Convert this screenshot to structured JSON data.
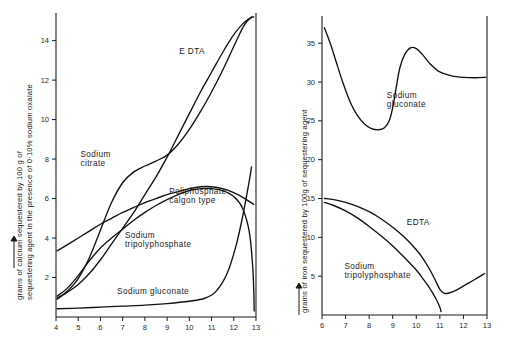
{
  "figure": {
    "background": "#ffffff",
    "ink_color": "#111111"
  },
  "chart_data": [
    {
      "id": "left-panel",
      "type": "line",
      "title": "",
      "xlabel": "",
      "ylabel": "grams of calcium sequestered by 100 g of sequestering agent in the presence of 0·10% sodium oxalate",
      "ylabel_line1": "grams of calcium sequestered by 100 g of",
      "ylabel_line2": "sequestering agent in the presence of 0·10% sodium oxalate",
      "xlim": [
        4,
        13
      ],
      "ylim": [
        0,
        15.4
      ],
      "xticks": [
        4,
        5,
        6,
        7,
        8,
        9,
        10,
        11,
        12,
        13
      ],
      "xticklabels": [
        "4",
        "5",
        "6",
        "7",
        "8",
        "9",
        "10",
        "11",
        "12",
        "13"
      ],
      "yticks": [
        2,
        4,
        6,
        8,
        10,
        12,
        14
      ],
      "yticklabels": [
        "2",
        "4",
        "6",
        "8",
        "10",
        "12",
        "14"
      ],
      "grid": false,
      "legend_position": "inline-labels",
      "series": [
        {
          "name": "EDTA",
          "label": "E DTA",
          "label_x": 9.55,
          "label_y": 13.3,
          "points": [
            [
              4.05,
              0.95
            ],
            [
              4.5,
              1.25
            ],
            [
              5.0,
              1.65
            ],
            [
              5.5,
              2.2
            ],
            [
              6.0,
              2.9
            ],
            [
              6.5,
              3.7
            ],
            [
              7.0,
              4.5
            ],
            [
              7.5,
              5.3
            ],
            [
              8.0,
              6.2
            ],
            [
              8.5,
              7.1
            ],
            [
              9.0,
              8.1
            ],
            [
              9.5,
              9.2
            ],
            [
              10.0,
              10.3
            ],
            [
              10.5,
              11.4
            ],
            [
              11.0,
              12.4
            ],
            [
              11.5,
              13.4
            ],
            [
              12.0,
              14.3
            ],
            [
              12.4,
              14.85
            ],
            [
              12.75,
              15.15
            ],
            [
              12.9,
              15.2
            ]
          ]
        },
        {
          "name": "Sodium citrate",
          "label_line1": "Sodium",
          "label_line2": "citrate",
          "label_x": 5.1,
          "label_y": 8.1,
          "points": [
            [
              4.05,
              0.9
            ],
            [
              4.5,
              1.3
            ],
            [
              5.0,
              1.95
            ],
            [
              5.5,
              3.0
            ],
            [
              6.0,
              4.4
            ],
            [
              6.5,
              5.8
            ],
            [
              7.0,
              6.8
            ],
            [
              7.5,
              7.35
            ],
            [
              8.0,
              7.65
            ],
            [
              8.5,
              7.9
            ],
            [
              9.0,
              8.2
            ],
            [
              9.5,
              8.75
            ],
            [
              10.0,
              9.5
            ],
            [
              10.5,
              10.4
            ],
            [
              11.0,
              11.4
            ],
            [
              11.5,
              12.5
            ],
            [
              12.0,
              13.7
            ],
            [
              12.45,
              14.75
            ],
            [
              12.8,
              15.2
            ]
          ]
        },
        {
          "name": "Poliphosphate calgon type",
          "label_line1": "Poliphosphate",
          "label_line2": "calgon type",
          "label_x": 9.1,
          "label_y": 6.25,
          "points": [
            [
              4.05,
              3.35
            ],
            [
              4.5,
              3.65
            ],
            [
              5.0,
              4.0
            ],
            [
              5.5,
              4.35
            ],
            [
              6.0,
              4.7
            ],
            [
              6.5,
              5.0
            ],
            [
              7.0,
              5.3
            ],
            [
              7.5,
              5.55
            ],
            [
              8.0,
              5.8
            ],
            [
              8.5,
              6.0
            ],
            [
              9.0,
              6.2
            ],
            [
              9.5,
              6.35
            ],
            [
              10.0,
              6.5
            ],
            [
              10.5,
              6.6
            ],
            [
              11.0,
              6.6
            ],
            [
              11.5,
              6.5
            ],
            [
              12.0,
              6.3
            ],
            [
              12.5,
              6.0
            ],
            [
              12.9,
              5.7
            ]
          ]
        },
        {
          "name": "Sodium tripolyphosphate",
          "label_line1": "Sodium",
          "label_line2": "tripolyphosphate",
          "label_x": 7.1,
          "label_y": 4.0,
          "points": [
            [
              4.05,
              1.05
            ],
            [
              4.5,
              1.45
            ],
            [
              5.0,
              2.1
            ],
            [
              5.5,
              2.85
            ],
            [
              6.0,
              3.5
            ],
            [
              6.5,
              4.0
            ],
            [
              7.0,
              4.45
            ],
            [
              7.5,
              4.9
            ],
            [
              8.0,
              5.3
            ],
            [
              8.5,
              5.65
            ],
            [
              9.0,
              5.95
            ],
            [
              9.5,
              6.2
            ],
            [
              10.0,
              6.4
            ],
            [
              10.5,
              6.5
            ],
            [
              11.0,
              6.5
            ],
            [
              11.5,
              6.4
            ],
            [
              12.0,
              6.1
            ],
            [
              12.4,
              5.5
            ],
            [
              12.7,
              4.3
            ],
            [
              12.85,
              2.6
            ],
            [
              12.9,
              1.3
            ],
            [
              12.92,
              0.3
            ]
          ]
        },
        {
          "name": "Sodium gluconate",
          "label": "Sodium  gluconate",
          "label_x": 6.75,
          "label_y": 1.15,
          "points": [
            [
              4.05,
              0.42
            ],
            [
              5.0,
              0.45
            ],
            [
              6.0,
              0.5
            ],
            [
              7.0,
              0.55
            ],
            [
              8.0,
              0.6
            ],
            [
              9.0,
              0.68
            ],
            [
              10.0,
              0.8
            ],
            [
              10.7,
              0.95
            ],
            [
              11.2,
              1.3
            ],
            [
              11.7,
              2.2
            ],
            [
              12.1,
              3.6
            ],
            [
              12.4,
              5.1
            ],
            [
              12.65,
              6.6
            ],
            [
              12.8,
              7.6
            ]
          ]
        }
      ]
    },
    {
      "id": "right-panel",
      "type": "line",
      "title": "",
      "xlabel": "",
      "ylabel": "grams of iron sequestered by 100g of sequestering agent",
      "xlim": [
        6,
        13
      ],
      "ylim": [
        0,
        38.5
      ],
      "xticks": [
        6,
        7,
        8,
        9,
        10,
        11,
        12,
        13
      ],
      "xticklabels": [
        "6",
        "7",
        "8",
        "9",
        "10",
        "11",
        "12",
        "13"
      ],
      "yticks": [
        5,
        10,
        15,
        20,
        25,
        30,
        35
      ],
      "yticklabels": [
        "5",
        "10",
        "15",
        "20",
        "25",
        "30",
        "35"
      ],
      "grid": false,
      "legend_position": "inline-labels",
      "series": [
        {
          "name": "Sodium gluconate",
          "label_line1": "Sodium",
          "label_line2": "gluconate",
          "label_x": 8.75,
          "label_y": 28.0,
          "points": [
            [
              6.1,
              37.0
            ],
            [
              6.35,
              35.0
            ],
            [
              6.6,
              32.6
            ],
            [
              6.9,
              29.8
            ],
            [
              7.2,
              27.4
            ],
            [
              7.5,
              25.7
            ],
            [
              7.8,
              24.6
            ],
            [
              8.1,
              24.0
            ],
            [
              8.4,
              23.85
            ],
            [
              8.65,
              24.1
            ],
            [
              8.85,
              25.0
            ],
            [
              9.0,
              26.7
            ],
            [
              9.15,
              29.3
            ],
            [
              9.3,
              31.8
            ],
            [
              9.5,
              33.5
            ],
            [
              9.75,
              34.4
            ],
            [
              10.0,
              34.3
            ],
            [
              10.3,
              33.4
            ],
            [
              10.6,
              32.3
            ],
            [
              11.0,
              31.3
            ],
            [
              11.5,
              30.8
            ],
            [
              12.0,
              30.6
            ],
            [
              12.5,
              30.55
            ],
            [
              12.95,
              30.6
            ]
          ]
        },
        {
          "name": "EDTA",
          "label": "EDTA",
          "label_x": 9.6,
          "label_y": 11.6,
          "points": [
            [
              6.1,
              15.0
            ],
            [
              6.5,
              14.85
            ],
            [
              7.0,
              14.5
            ],
            [
              7.5,
              14.0
            ],
            [
              8.0,
              13.3
            ],
            [
              8.5,
              12.4
            ],
            [
              9.0,
              11.3
            ],
            [
              9.5,
              10.0
            ],
            [
              10.0,
              8.4
            ],
            [
              10.3,
              7.2
            ],
            [
              10.6,
              5.7
            ],
            [
              10.85,
              4.2
            ],
            [
              11.0,
              3.3
            ],
            [
              11.15,
              2.85
            ],
            [
              11.35,
              2.8
            ],
            [
              11.7,
              3.2
            ],
            [
              12.1,
              3.9
            ],
            [
              12.5,
              4.6
            ],
            [
              12.9,
              5.35
            ]
          ]
        },
        {
          "name": "Sodium tripolyphosphate",
          "label_line1": "Sodium",
          "label_line2": "tripolyphosphate",
          "label_x": 6.95,
          "label_y": 5.9,
          "points": [
            [
              6.1,
              14.5
            ],
            [
              6.5,
              14.1
            ],
            [
              7.0,
              13.4
            ],
            [
              7.5,
              12.5
            ],
            [
              8.0,
              11.4
            ],
            [
              8.5,
              10.2
            ],
            [
              9.0,
              8.9
            ],
            [
              9.5,
              7.4
            ],
            [
              10.0,
              5.8
            ],
            [
              10.3,
              4.6
            ],
            [
              10.6,
              3.3
            ],
            [
              10.85,
              2.0
            ],
            [
              11.0,
              1.0
            ],
            [
              11.05,
              0.45
            ]
          ]
        }
      ]
    }
  ]
}
